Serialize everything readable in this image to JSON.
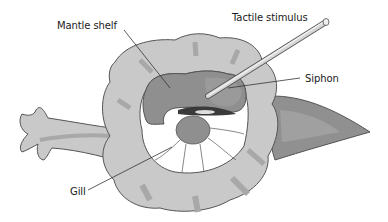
{
  "diagram": {
    "labels": {
      "mantle_shelf": "Mantle shelf",
      "tactile_stimulus": "Tactile stimulus",
      "siphon": "Siphon",
      "gill": "Gill"
    },
    "colors": {
      "body_light": "#c9c9c9",
      "body_mid": "#a8a8a8",
      "mantle": "#8f8f8f",
      "tail": "#909090",
      "gill_white": "#ffffff",
      "outline": "#555555",
      "probe": "#bdbdbd",
      "text": "#1a1a1a"
    }
  }
}
